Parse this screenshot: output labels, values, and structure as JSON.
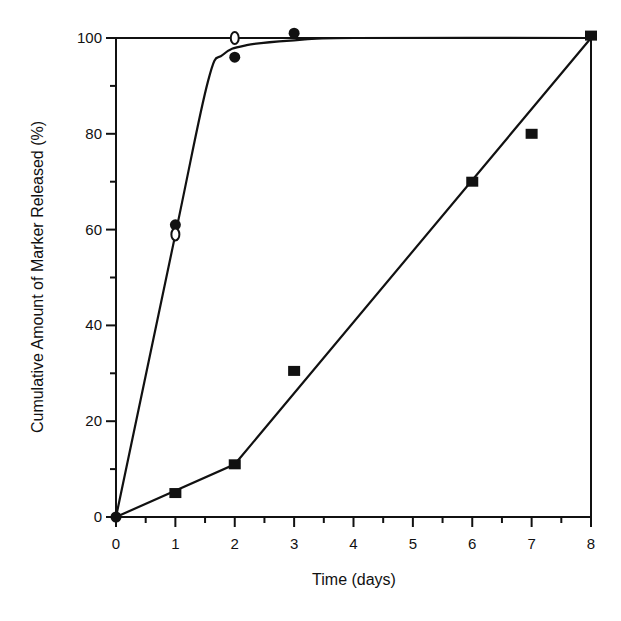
{
  "chart_data": {
    "type": "line",
    "title": "",
    "xlabel": "Time (days)",
    "ylabel": "Cumulative Amount of Marker Released (%)",
    "xlim": [
      0,
      8
    ],
    "ylim": [
      0,
      100
    ],
    "x_ticks": [
      0,
      1,
      2,
      3,
      4,
      5,
      6,
      7,
      8
    ],
    "x_minor_ticks": [
      0.5,
      1.5,
      2.5,
      3.5,
      4.5,
      5.5,
      6.5,
      7.5
    ],
    "y_ticks": [
      0,
      20,
      40,
      60,
      80,
      100
    ],
    "y_minor_ticks": [
      10,
      30,
      50,
      70,
      90
    ],
    "grid": false,
    "legend": null,
    "frame": "box",
    "series": [
      {
        "name": "filled-circles",
        "marker": "filled-circle",
        "x": [
          0,
          1,
          2,
          3
        ],
        "y": [
          0,
          61,
          96,
          101
        ]
      },
      {
        "name": "open-circles",
        "marker": "open-circle",
        "x": [
          1,
          2
        ],
        "y": [
          59,
          100
        ]
      },
      {
        "name": "filled-squares",
        "marker": "filled-square",
        "x": [
          1,
          2,
          3,
          6,
          7,
          8
        ],
        "y": [
          5,
          11,
          30.5,
          70,
          80,
          100.5
        ]
      }
    ],
    "fit_curves": [
      {
        "name": "fast-release-fit",
        "style": "smooth",
        "points": [
          [
            0,
            0
          ],
          [
            1,
            59
          ],
          [
            1.55,
            91
          ],
          [
            1.8,
            96.5
          ],
          [
            2.2,
            98.5
          ],
          [
            3,
            99.5
          ],
          [
            4,
            100
          ],
          [
            8,
            100
          ]
        ]
      },
      {
        "name": "slow-release-fit",
        "style": "polyline",
        "points": [
          [
            0,
            0
          ],
          [
            2,
            11
          ],
          [
            8,
            100
          ]
        ]
      }
    ]
  }
}
